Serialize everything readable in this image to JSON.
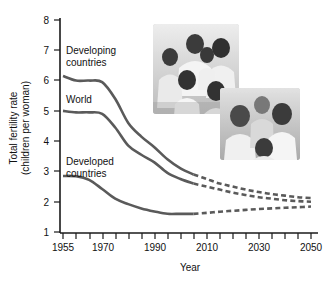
{
  "chart_data": {
    "type": "line",
    "title": "",
    "xlabel": "Year",
    "ylabel": "Total fertility rate\n(children per woman)",
    "ylabel_line1": "Total fertility rate",
    "ylabel_line2": "(children per woman)",
    "xlim": [
      1955,
      2050
    ],
    "ylim": [
      1,
      8
    ],
    "yticks": [
      1,
      2,
      3,
      4,
      5,
      6,
      7,
      8
    ],
    "ytick_labels": [
      "1",
      "2",
      "3",
      "4",
      "5",
      "6",
      "7",
      "8"
    ],
    "xticks": [
      1955,
      1960,
      1965,
      1970,
      1975,
      1980,
      1985,
      1990,
      1995,
      2000,
      2005,
      2010,
      2015,
      2020,
      2025,
      2030,
      2035,
      2040,
      2045,
      2050
    ],
    "xtick_labels_shown": [
      "1955",
      "1970",
      "1990",
      "2010",
      "2030",
      "2050"
    ],
    "xtick_label_years": [
      1955,
      1970,
      1990,
      2010,
      2030,
      2050
    ],
    "grid": false,
    "legend_position": "inline-annotations",
    "projection_start_year": 2005,
    "series": [
      {
        "name": "Developing countries",
        "label": "Developing\ncountries",
        "label_line1": "Developing",
        "label_line2": "countries",
        "color": "#5a5a5a",
        "x": [
          1955,
          1960,
          1965,
          1970,
          1975,
          1980,
          1985,
          1990,
          1995,
          2000,
          2005,
          2010,
          2015,
          2020,
          2025,
          2030,
          2035,
          2040,
          2045,
          2050
        ],
        "values": [
          6.15,
          6.0,
          6.0,
          5.95,
          5.4,
          4.6,
          4.15,
          3.8,
          3.4,
          3.1,
          2.9,
          2.75,
          2.6,
          2.5,
          2.4,
          2.32,
          2.25,
          2.2,
          2.15,
          2.12
        ]
      },
      {
        "name": "World",
        "label": "World",
        "color": "#5a5a5a",
        "x": [
          1955,
          1960,
          1965,
          1970,
          1975,
          1980,
          1985,
          1990,
          1995,
          2000,
          2005,
          2010,
          2015,
          2020,
          2025,
          2030,
          2035,
          2040,
          2045,
          2050
        ],
        "values": [
          5.0,
          4.95,
          4.95,
          4.9,
          4.45,
          3.85,
          3.55,
          3.3,
          2.95,
          2.75,
          2.6,
          2.5,
          2.4,
          2.3,
          2.22,
          2.15,
          2.1,
          2.05,
          2.02,
          2.0
        ]
      },
      {
        "name": "Developed countries",
        "label": "Developed\ncountries",
        "label_line1": "Developed",
        "label_line2": "countries",
        "color": "#5a5a5a",
        "x": [
          1955,
          1960,
          1965,
          1970,
          1975,
          1980,
          1985,
          1990,
          1995,
          2000,
          2005,
          2010,
          2015,
          2020,
          2025,
          2030,
          2035,
          2040,
          2045,
          2050
        ],
        "values": [
          2.85,
          2.84,
          2.72,
          2.42,
          2.1,
          1.92,
          1.78,
          1.68,
          1.6,
          1.6,
          1.6,
          1.63,
          1.67,
          1.7,
          1.73,
          1.76,
          1.78,
          1.8,
          1.82,
          1.84
        ]
      }
    ],
    "annotations": [
      {
        "name": "photo-developing-family",
        "caption": "photograph of a large family"
      },
      {
        "name": "photo-developed-family",
        "caption": "photograph of a small family"
      }
    ]
  },
  "axis": {
    "y_title_line1": "Total fertility rate",
    "y_title_line2": "(children per woman)",
    "x_title": "Year"
  },
  "labels": {
    "developing_line1": "Developing",
    "developing_line2": "countries",
    "world": "World",
    "developed_line1": "Developed",
    "developed_line2": "countries"
  },
  "yticks": {
    "t8": "8",
    "t7": "7",
    "t6": "6",
    "t5": "5",
    "t4": "4",
    "t3": "3",
    "t2": "2",
    "t1": "1"
  },
  "xticks": {
    "x1955": "1955",
    "x1970": "1970",
    "x1990": "1990",
    "x2010": "2010",
    "x2030": "2030",
    "x2050": "2050"
  }
}
